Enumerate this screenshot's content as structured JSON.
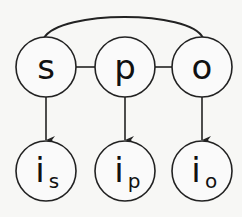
{
  "diagram": {
    "colors": {
      "background": "#f7f7f5",
      "stroke": "#222222",
      "text": "#111111",
      "node_fill": "#fafafa"
    },
    "top_nodes": [
      {
        "id": "s",
        "label": "s",
        "cx": 46,
        "cy": 67,
        "r": 30
      },
      {
        "id": "p",
        "label": "p",
        "cx": 125,
        "cy": 67,
        "r": 30
      },
      {
        "id": "o",
        "label": "o",
        "cx": 202,
        "cy": 67,
        "r": 30
      }
    ],
    "bottom_nodes": [
      {
        "id": "i_s",
        "label": "i",
        "subscript": "s",
        "cx": 46,
        "cy": 171,
        "r": 30
      },
      {
        "id": "i_p",
        "label": "i",
        "subscript": "p",
        "cx": 125,
        "cy": 171,
        "r": 30
      },
      {
        "id": "i_o",
        "label": "i",
        "subscript": "o",
        "cx": 202,
        "cy": 171,
        "r": 30
      }
    ],
    "edges": [
      {
        "from": "s",
        "to": "p",
        "type": "line"
      },
      {
        "from": "p",
        "to": "o",
        "type": "line"
      },
      {
        "from": "s",
        "to": "o",
        "type": "arc"
      },
      {
        "from": "s",
        "to": "i_s",
        "type": "arrow"
      },
      {
        "from": "p",
        "to": "i_p",
        "type": "arrow"
      },
      {
        "from": "o",
        "to": "i_o",
        "type": "arrow"
      }
    ]
  }
}
